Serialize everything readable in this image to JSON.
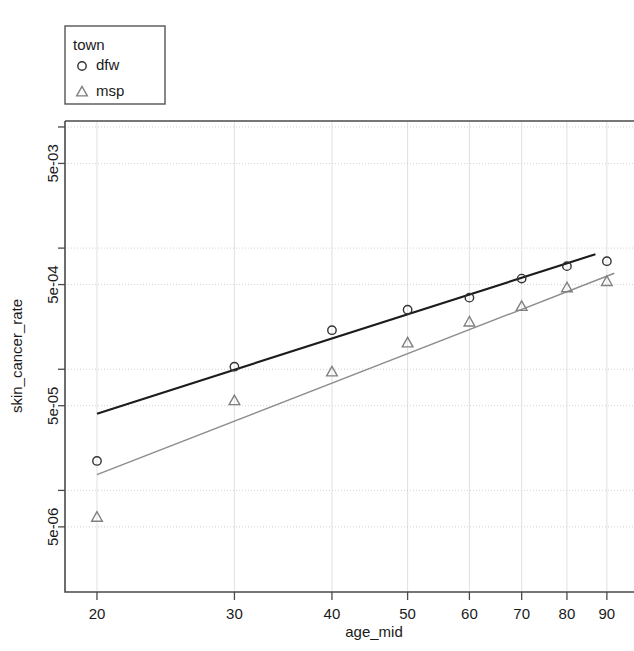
{
  "legend": {
    "title": "town",
    "position": "top-left",
    "entries": [
      {
        "label": "dfw",
        "marker": "circle-marker-icon",
        "color": "#333333"
      },
      {
        "label": "msp",
        "marker": "triangle-marker-icon",
        "color": "#808080"
      }
    ]
  },
  "chart_data": {
    "type": "scatter",
    "title": "",
    "subtitle": "",
    "xlabel": "age_mid",
    "ylabel": "skin_cancer_rate",
    "xscale": "log",
    "yscale": "log",
    "xlim": [
      18.2,
      97.5
    ],
    "ylim": [
      1.45e-06,
      0.0112
    ],
    "xticks": [
      20,
      30,
      40,
      50,
      60,
      70,
      80,
      90
    ],
    "xtick_labels": [
      "20",
      "30",
      "40",
      "50",
      "60",
      "70",
      "80",
      "90"
    ],
    "yticks": [
      5e-06,
      5e-05,
      0.0005,
      0.005
    ],
    "ytick_labels": [
      "5e-06",
      "5e-05",
      "5e-04",
      "5e-03"
    ],
    "yticks_minor": [
      1e-05,
      0.0001,
      0.001,
      0.01
    ],
    "grid": true,
    "legend_position": "top-left",
    "x": [
      20,
      30,
      40,
      50,
      60,
      70,
      80,
      90
    ],
    "series": [
      {
        "name": "dfw",
        "marker": "circle",
        "color": "#333333",
        "values": [
          1.75e-05,
          0.000105,
          0.00021,
          0.00031,
          0.00039,
          0.00056,
          0.00071,
          0.00078
        ],
        "fit_line": {
          "x_start": 20.0,
          "x_end": 87.0,
          "y_start": 4.3e-05,
          "y_end": 0.00089
        }
      },
      {
        "name": "msp",
        "marker": "triangle",
        "color": "#808080",
        "values": [
          6e-06,
          5.5e-05,
          9.5e-05,
          0.000165,
          0.000245,
          0.00033,
          0.00047,
          0.00053
        ],
        "fit_line": {
          "x_start": 20.0,
          "x_end": 92.0,
          "y_start": 1.35e-05,
          "y_end": 0.00062
        }
      }
    ]
  }
}
